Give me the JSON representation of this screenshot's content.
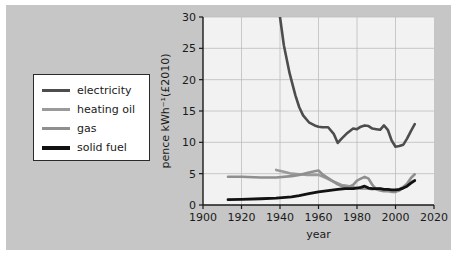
{
  "figure": {
    "background_color": "#c6c6c6",
    "plot_background_color": "#f2f2f2",
    "frame_color": "#1a1a1a"
  },
  "legend": {
    "position": "left",
    "items": [
      {
        "label": "electricity",
        "color": "#4d4d4d"
      },
      {
        "label": "heating oil",
        "color": "#9a9a9a"
      },
      {
        "label": "gas",
        "color": "#8f8f8f"
      },
      {
        "label": "solid fuel",
        "color": "#111111"
      }
    ]
  },
  "chart_data": {
    "type": "line",
    "title": "",
    "xlabel": "year",
    "ylabel": "pence kWh⁻¹(£2010)",
    "xlim": [
      1900,
      2020
    ],
    "ylim": [
      0,
      30
    ],
    "xticks": [
      1900,
      1920,
      1940,
      1960,
      1980,
      2000,
      2020
    ],
    "xtick_labels": [
      "1900",
      "1920",
      "1940",
      "1960",
      "1980",
      "2000",
      "2020"
    ],
    "yticks": [
      0,
      5,
      10,
      15,
      20,
      25,
      30
    ],
    "ytick_labels": [
      "0",
      "5",
      "10",
      "15",
      "20",
      "25",
      "30"
    ],
    "grid": true,
    "legend_position": "outside-left",
    "series": [
      {
        "name": "electricity",
        "color": "#4d4d4d",
        "linewidth": 2.6,
        "note": "clipped at top of axis above 30",
        "x": [
          1938,
          1940,
          1942,
          1945,
          1948,
          1950,
          1952,
          1955,
          1958,
          1960,
          1962,
          1965,
          1968,
          1970,
          1972,
          1975,
          1978,
          1980,
          1982,
          1984,
          1986,
          1988,
          1990,
          1992,
          1994,
          1996,
          1998,
          2000,
          2002,
          2004,
          2006,
          2008,
          2010
        ],
        "y": [
          34.0,
          30.0,
          25.5,
          21.0,
          17.5,
          15.6,
          14.3,
          13.2,
          12.7,
          12.5,
          12.4,
          12.4,
          11.3,
          9.9,
          10.6,
          11.5,
          12.2,
          12.1,
          12.5,
          12.7,
          12.6,
          12.2,
          12.1,
          12.0,
          12.7,
          12.0,
          10.3,
          9.3,
          9.4,
          9.6,
          10.6,
          11.8,
          12.9
        ]
      },
      {
        "name": "heating oil",
        "color": "#9a9a9a",
        "linewidth": 2.6,
        "x": [
          1938,
          1942,
          1946,
          1950,
          1954,
          1958,
          1960,
          1964,
          1968,
          1972,
          1974,
          1976,
          1980,
          1982,
          1984,
          1986,
          1988,
          1990,
          1992,
          1994,
          1996,
          1998,
          2000,
          2002,
          2004,
          2006,
          2008,
          2010
        ],
        "y": [
          5.6,
          5.3,
          5.0,
          4.9,
          4.8,
          4.8,
          4.8,
          4.3,
          3.7,
          3.2,
          3.1,
          3.0,
          2.7,
          2.6,
          2.6,
          2.6,
          2.5,
          2.6,
          2.6,
          2.5,
          2.4,
          2.3,
          2.2,
          2.5,
          2.9,
          3.3,
          3.7,
          3.9
        ]
      },
      {
        "name": "gas",
        "color": "#8f8f8f",
        "linewidth": 2.6,
        "x": [
          1913,
          1920,
          1930,
          1938,
          1946,
          1950,
          1954,
          1958,
          1960,
          1962,
          1965,
          1968,
          1970,
          1972,
          1975,
          1978,
          1980,
          1982,
          1984,
          1986,
          1988,
          1990,
          1992,
          1994,
          1996,
          1998,
          2000,
          2002,
          2004,
          2006,
          2008,
          2010
        ],
        "y": [
          4.5,
          4.5,
          4.4,
          4.4,
          4.6,
          4.8,
          5.1,
          5.4,
          5.5,
          4.9,
          4.3,
          3.7,
          3.3,
          3.0,
          2.8,
          3.2,
          3.9,
          4.2,
          4.5,
          4.2,
          3.2,
          2.5,
          2.3,
          2.2,
          2.2,
          2.1,
          2.1,
          2.3,
          2.8,
          3.4,
          4.3,
          4.9
        ]
      },
      {
        "name": "solid fuel",
        "color": "#111111",
        "linewidth": 2.8,
        "x": [
          1913,
          1920,
          1930,
          1938,
          1946,
          1950,
          1955,
          1960,
          1965,
          1970,
          1974,
          1978,
          1980,
          1982,
          1984,
          1986,
          1988,
          1990,
          1992,
          1994,
          1996,
          1998,
          2000,
          2002,
          2004,
          2006,
          2008,
          2010
        ],
        "y": [
          0.85,
          0.9,
          1.0,
          1.1,
          1.3,
          1.5,
          1.8,
          2.1,
          2.3,
          2.5,
          2.6,
          2.6,
          2.7,
          2.8,
          3.0,
          2.7,
          2.6,
          2.6,
          2.6,
          2.5,
          2.5,
          2.4,
          2.4,
          2.5,
          2.7,
          3.0,
          3.5,
          3.9
        ]
      }
    ]
  }
}
